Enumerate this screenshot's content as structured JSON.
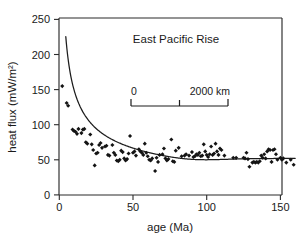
{
  "figure": {
    "title": "East Pacific Rise",
    "background_color": "#ffffff",
    "ink_color": "#1a1a1a"
  },
  "scalebar": {
    "left_label": "0",
    "right_label": "2000 km",
    "ticks": [
      0,
      1000,
      2000
    ],
    "x_start_px": 131,
    "x_end_px": 228,
    "y_px": 103
  },
  "chart_data": {
    "type": "scatter",
    "title": "East Pacific Rise",
    "xlabel": "age (Ma)",
    "ylabel": "heat flux (mW/m²)",
    "xlim": [
      0,
      160
    ],
    "ylim": [
      0,
      250
    ],
    "xticks": [
      0,
      50,
      100,
      150
    ],
    "yticks": [
      0,
      50,
      100,
      150,
      200,
      250
    ],
    "grid": false,
    "legend": null,
    "marker": "diamond",
    "marker_color": "#141414",
    "series": [
      {
        "name": "heat flux observations",
        "type": "scatter",
        "points": [
          [
            2,
            155
          ],
          [
            5,
            131
          ],
          [
            6,
            127
          ],
          [
            9,
            93
          ],
          [
            10,
            91
          ],
          [
            11,
            90
          ],
          [
            12,
            87
          ],
          [
            13,
            94
          ],
          [
            15,
            88
          ],
          [
            16,
            93
          ],
          [
            17,
            94
          ],
          [
            18,
            75
          ],
          [
            19,
            73
          ],
          [
            21,
            86
          ],
          [
            22,
            72
          ],
          [
            23,
            64
          ],
          [
            24,
            42
          ],
          [
            25,
            59
          ],
          [
            26,
            60
          ],
          [
            27,
            71
          ],
          [
            28,
            74
          ],
          [
            29,
            67
          ],
          [
            31,
            69
          ],
          [
            32,
            70
          ],
          [
            33,
            57
          ],
          [
            34,
            56
          ],
          [
            36,
            71
          ],
          [
            37,
            60
          ],
          [
            38,
            57
          ],
          [
            39,
            49
          ],
          [
            40,
            48
          ],
          [
            41,
            50
          ],
          [
            42,
            63
          ],
          [
            43,
            61
          ],
          [
            44,
            52
          ],
          [
            45,
            49
          ],
          [
            46,
            51
          ],
          [
            47,
            59
          ],
          [
            48,
            84
          ],
          [
            50,
            60
          ],
          [
            51,
            62
          ],
          [
            52,
            56
          ],
          [
            54,
            65
          ],
          [
            55,
            62
          ],
          [
            56,
            60
          ],
          [
            57,
            57
          ],
          [
            58,
            73
          ],
          [
            59,
            60
          ],
          [
            60,
            55
          ],
          [
            61,
            50
          ],
          [
            62,
            49
          ],
          [
            63,
            52
          ],
          [
            65,
            34
          ],
          [
            66,
            53
          ],
          [
            67,
            47
          ],
          [
            68,
            57
          ],
          [
            70,
            58
          ],
          [
            71,
            66
          ],
          [
            72,
            52
          ],
          [
            73,
            49
          ],
          [
            74,
            51
          ],
          [
            76,
            79
          ],
          [
            77,
            48
          ],
          [
            78,
            47
          ],
          [
            79,
            63
          ],
          [
            81,
            67
          ],
          [
            83,
            55
          ],
          [
            85,
            56
          ],
          [
            86,
            58
          ],
          [
            88,
            56
          ],
          [
            90,
            61
          ],
          [
            91,
            54
          ],
          [
            92,
            55
          ],
          [
            93,
            58
          ],
          [
            94,
            57
          ],
          [
            95,
            60
          ],
          [
            96,
            55
          ],
          [
            97,
            56
          ],
          [
            98,
            72
          ],
          [
            99,
            62
          ],
          [
            100,
            57
          ],
          [
            101,
            54
          ],
          [
            102,
            58
          ],
          [
            103,
            69
          ],
          [
            104,
            57
          ],
          [
            105,
            59
          ],
          [
            106,
            73
          ],
          [
            107,
            62
          ],
          [
            108,
            57
          ],
          [
            109,
            66
          ],
          [
            110,
            64
          ],
          [
            112,
            56
          ],
          [
            118,
            53
          ],
          [
            120,
            53
          ],
          [
            125,
            53
          ],
          [
            126,
            52
          ],
          [
            127,
            60
          ],
          [
            128,
            51
          ],
          [
            129,
            40
          ],
          [
            131,
            46
          ],
          [
            132,
            47
          ],
          [
            133,
            46
          ],
          [
            134,
            47
          ],
          [
            135,
            46
          ],
          [
            136,
            48
          ],
          [
            137,
            56
          ],
          [
            138,
            53
          ],
          [
            139,
            58
          ],
          [
            140,
            52
          ],
          [
            141,
            62
          ],
          [
            142,
            65
          ],
          [
            143,
            64
          ],
          [
            144,
            47
          ],
          [
            145,
            64
          ],
          [
            146,
            65
          ],
          [
            147,
            58
          ],
          [
            148,
            50
          ],
          [
            150,
            53
          ],
          [
            151,
            50
          ],
          [
            152,
            52
          ],
          [
            154,
            46
          ],
          [
            157,
            50
          ],
          [
            159,
            43
          ]
        ]
      },
      {
        "name": "half-space cooling model",
        "type": "line",
        "description": "q = 473 / sqrt(age), flattening to a plate-model asymptote near 52 mW/m²",
        "coefficient": 473,
        "asymptote": 52,
        "age_start": 4.4,
        "age_end": 160
      }
    ]
  }
}
